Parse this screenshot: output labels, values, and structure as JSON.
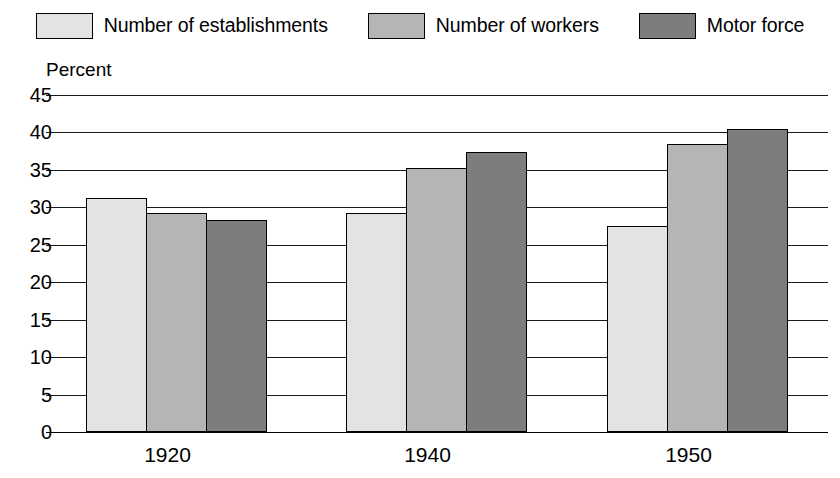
{
  "legend": {
    "items": [
      {
        "label": "Number of establishments",
        "swatch_color": "#e3e3e3",
        "icon": "legend-swatch-light"
      },
      {
        "label": "Number of workers",
        "swatch_color": "#b5b5b5",
        "icon": "legend-swatch-medium"
      },
      {
        "label": "Motor force",
        "swatch_color": "#7d7d7d",
        "icon": "legend-swatch-dark"
      }
    ]
  },
  "axis": {
    "y_title": "Percent",
    "y_ticks": [
      "45",
      "40",
      "35",
      "30",
      "25",
      "20",
      "15",
      "10",
      "5",
      "0"
    ],
    "x_ticks": [
      "1920",
      "1940",
      "1950"
    ]
  },
  "chart_data": {
    "type": "bar",
    "title": "",
    "subtitle": "",
    "xlabel": "",
    "ylabel": "Percent",
    "ylim": [
      0,
      45
    ],
    "ytick_step": 5,
    "grid": true,
    "legend_position": "top",
    "categories": [
      "1920",
      "1940",
      "1950"
    ],
    "series": [
      {
        "name": "Number of establishments",
        "color": "#e3e3e3",
        "values": [
          31.2,
          29.3,
          27.5
        ]
      },
      {
        "name": "Number of workers",
        "color": "#b5b5b5",
        "values": [
          29.2,
          35.2,
          38.5
        ]
      },
      {
        "name": "Motor force",
        "color": "#7d7d7d",
        "values": [
          28.3,
          37.4,
          40.4
        ]
      }
    ]
  }
}
